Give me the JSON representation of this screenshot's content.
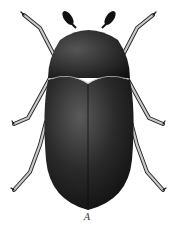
{
  "figure": {
    "label": "A",
    "colors": {
      "body": "#151515",
      "highlight": "#4a4a4a",
      "legs": "#bdbdbd",
      "background": "#ffffff"
    }
  }
}
